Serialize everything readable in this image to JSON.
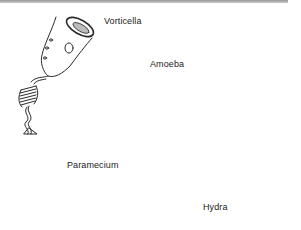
{
  "figure": {
    "top_rule_color": "#a8a8a8",
    "ink_color": "#2a2a2a",
    "organisms": [
      {
        "id": "vorticella",
        "label": "Vorticella"
      },
      {
        "id": "amoeba",
        "label": "Amoeba"
      },
      {
        "id": "paramecium",
        "label": "Paramecium"
      },
      {
        "id": "hydra",
        "label": "Hydra"
      }
    ]
  }
}
